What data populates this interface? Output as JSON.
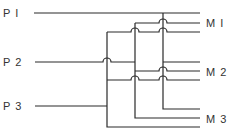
{
  "diagram": {
    "type": "wiring-crossbar",
    "inputs": [
      {
        "id": "P1",
        "label": "P I",
        "y": 13,
        "bus_x": 163
      },
      {
        "id": "P2",
        "label": "P 2",
        "y": 62,
        "bus_x": 135
      },
      {
        "id": "P3",
        "label": "P 3",
        "y": 106,
        "bus_x": 107
      }
    ],
    "outputs": [
      {
        "id": "M1",
        "label": "M I",
        "lines_y": [
          13,
          23,
          32
        ],
        "label_y": 26
      },
      {
        "id": "M2",
        "label": "M 2",
        "lines_y": [
          62,
          71,
          80
        ],
        "label_y": 75
      },
      {
        "id": "M3",
        "label": "M 3",
        "lines_y": [
          109,
          118,
          127
        ],
        "label_y": 122
      }
    ],
    "connections": "Each input P feeds one line in every output group M; crossings shown with hop-over arcs",
    "line_color": "#2a2a2a"
  }
}
